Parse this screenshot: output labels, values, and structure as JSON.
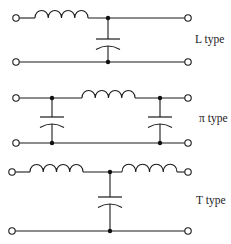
{
  "diagram": {
    "kind": "LC filter topologies",
    "stroke_color": "#1a1a1a",
    "background": "#ffffff",
    "circuits": [
      {
        "id": "l-type",
        "label": "L type",
        "top_y": 18,
        "bottom_y": 62,
        "left_terminal_x": 16,
        "right_terminal_x": 188,
        "inductors": [
          {
            "x1": 35,
            "x2": 88,
            "turns": 4
          }
        ],
        "capacitors": [
          {
            "x": 108,
            "flat_y": 39,
            "curved_y": 46
          }
        ],
        "junctions": [
          {
            "x": 108,
            "y": 18
          },
          {
            "x": 108,
            "y": 62
          }
        ],
        "label_pos": {
          "x": 195,
          "y": 34
        }
      },
      {
        "id": "pi-type",
        "label": "π type",
        "top_y": 98,
        "bottom_y": 143,
        "left_terminal_x": 16,
        "right_terminal_x": 188,
        "inductors": [
          {
            "x1": 82,
            "x2": 135,
            "turns": 4
          }
        ],
        "capacitors": [
          {
            "x": 52,
            "flat_y": 117,
            "curved_y": 124
          },
          {
            "x": 160,
            "flat_y": 117,
            "curved_y": 124
          }
        ],
        "junctions": [
          {
            "x": 52,
            "y": 98
          },
          {
            "x": 52,
            "y": 143
          },
          {
            "x": 160,
            "y": 98
          },
          {
            "x": 160,
            "y": 143
          }
        ],
        "label_pos": {
          "x": 199,
          "y": 113
        }
      },
      {
        "id": "t-type",
        "label": "T type",
        "top_y": 172,
        "bottom_y": 231,
        "left_terminal_x": 12,
        "right_terminal_x": 188,
        "inductors": [
          {
            "x1": 30,
            "x2": 83,
            "turns": 4
          },
          {
            "x1": 122,
            "x2": 177,
            "turns": 4
          }
        ],
        "capacitors": [
          {
            "x": 110,
            "flat_y": 197,
            "curved_y": 204
          }
        ],
        "junctions": [
          {
            "x": 110,
            "y": 172
          },
          {
            "x": 110,
            "y": 231
          }
        ],
        "label_pos": {
          "x": 196,
          "y": 195
        }
      }
    ]
  }
}
